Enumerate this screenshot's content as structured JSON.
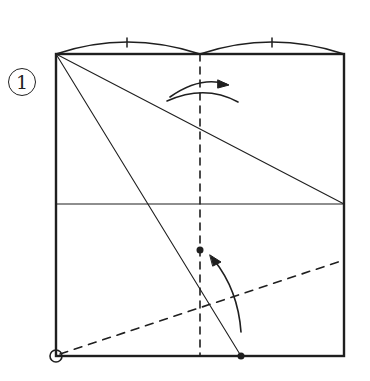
{
  "step": {
    "number": "1"
  },
  "colors": {
    "ink": "#1f1f1f",
    "background": "#ffffff"
  },
  "diagram": {
    "type": "origami-fold-instruction",
    "square": {
      "x1": 56,
      "y1": 54,
      "x2": 344,
      "y2": 356
    },
    "top_division_arcs": [
      {
        "from": [
          56,
          54
        ],
        "to": [
          200,
          54
        ],
        "tick_x": 127,
        "meaning": "equal half"
      },
      {
        "from": [
          200,
          54
        ],
        "to": [
          344,
          54
        ],
        "tick_x": 272,
        "meaning": "equal half"
      }
    ],
    "lines": [
      {
        "kind": "valley-fold-dashed",
        "from": [
          200,
          54
        ],
        "to": [
          200,
          356
        ]
      },
      {
        "kind": "crease",
        "from": [
          56,
          204
        ],
        "to": [
          344,
          204
        ]
      },
      {
        "kind": "crease",
        "from": [
          56,
          54
        ],
        "to": [
          344,
          204
        ]
      },
      {
        "kind": "crease",
        "from": [
          56,
          54
        ],
        "to": [
          241,
          356
        ]
      },
      {
        "kind": "valley-fold-dashed",
        "from": [
          56,
          356
        ],
        "to": [
          344,
          260
        ]
      }
    ],
    "points": [
      {
        "name": "target-dot",
        "at": [
          200,
          250
        ]
      },
      {
        "name": "source-dot",
        "at": [
          241,
          356
        ]
      },
      {
        "name": "pivot-circle",
        "at": [
          56,
          356
        ]
      }
    ],
    "arrows": [
      {
        "name": "fold-and-unfold-arrow",
        "description": "curved arrow over center line, fold and unfold"
      },
      {
        "name": "fold-arrow",
        "description": "curved arrow from bottom point up to target dot"
      }
    ]
  }
}
